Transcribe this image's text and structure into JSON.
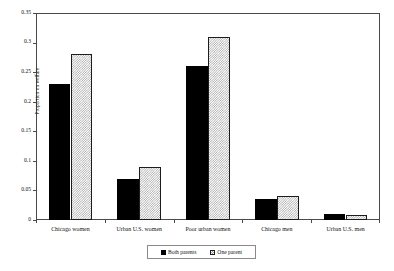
{
  "chart_data": {
    "type": "bar",
    "title": "",
    "xlabel": "",
    "ylabel": "Proportion on welfare",
    "ylim": [
      0,
      0.35
    ],
    "yticks": [
      "0",
      "0.05",
      "0.1",
      "0.15",
      "0.2",
      "0.25",
      "0.3",
      "0.35"
    ],
    "ytick_values": [
      0,
      0.05,
      0.1,
      0.15,
      0.2,
      0.25,
      0.3,
      0.35
    ],
    "grid": false,
    "legend_position": "bottom-center",
    "categories": [
      "Chicago women",
      "Urban U.S. women",
      "Poor urban women",
      "Chicago men",
      "Urban U.S. men"
    ],
    "series": [
      {
        "name": "Both parents",
        "values": [
          0.23,
          0.07,
          0.26,
          0.035,
          0.01
        ],
        "color": "#000000",
        "fill": "solid-black"
      },
      {
        "name": "One parent",
        "values": [
          0.28,
          0.089,
          0.309,
          0.04,
          0.009
        ],
        "color": "#a8a8a8",
        "fill": "checkerboard"
      }
    ]
  },
  "legend": {
    "items": [
      {
        "label": "Both parents",
        "swatch": "solid-black-swatch"
      },
      {
        "label": "One parent",
        "swatch": "checkerboard-swatch"
      }
    ]
  },
  "axis": {
    "y_title": "Proportion on welfare"
  }
}
